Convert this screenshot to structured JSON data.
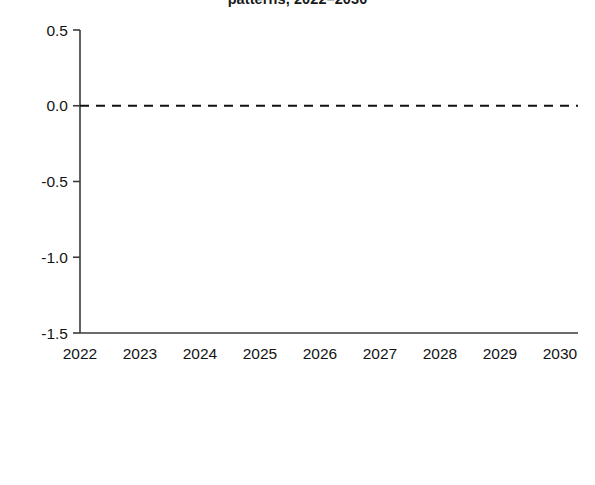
{
  "chart_data": {
    "type": "line",
    "title": "patterns, 2022–2030",
    "xlabel": "",
    "ylabel": "",
    "x": [
      2022,
      2023,
      2024,
      2025,
      2026,
      2027,
      2028,
      2029,
      2030
    ],
    "categories": [
      "2022",
      "2023",
      "2024",
      "2025",
      "2026",
      "2027",
      "2028",
      "2029",
      "2030"
    ],
    "xlim": [
      2022,
      2030
    ],
    "ylim": [
      -1.5,
      0.5
    ],
    "yticks": [
      0.5,
      0.0,
      -0.5,
      -1.0,
      -1.5
    ],
    "ytick_labels": [
      "0.5",
      "0.0",
      "-0.5",
      "-1.0",
      "-1.5"
    ],
    "grid": false,
    "zero_line": 0.0,
    "zero_line_style": "dashed",
    "legend_position": "bottom",
    "series": [
      {
        "name": "CA surplus, finance-unconstrained",
        "color": "#1c1c1c",
        "width": 3.4,
        "values": [
          0.49,
          -0.57,
          -1.01,
          -1.12,
          -1.15,
          -1.15,
          -1.14,
          -1.14,
          -1.13
        ]
      },
      {
        "name": "CA surplus, finance-constrained",
        "color": "#565656",
        "width": 2.4,
        "values": [
          -0.08,
          -0.73,
          -1.05,
          -1.21,
          -1.26,
          -1.28,
          -1.28,
          -1.28,
          -1.28
        ]
      },
      {
        "name": "CA deficit, finance-unconstrained",
        "color": "#d2d2d2",
        "width": 2.6,
        "values": [
          0.27,
          -0.09,
          -0.4,
          -0.6,
          -0.71,
          -0.76,
          -0.79,
          -0.82,
          -0.85
        ]
      },
      {
        "name": "CA deficit, finance-constrained",
        "color": "#9a9a9a",
        "width": 2.6,
        "values": [
          0.13,
          -0.15,
          -0.51,
          -0.68,
          -0.73,
          -0.79,
          -0.78,
          -0.76,
          -0.74
        ]
      }
    ]
  }
}
